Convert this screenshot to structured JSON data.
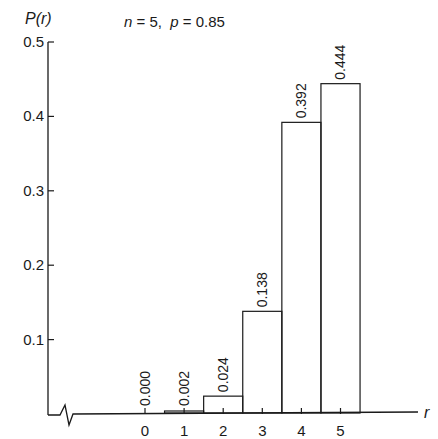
{
  "chart_data": {
    "type": "bar",
    "title": "",
    "subtitle": {
      "n_symbol": "n",
      "n_eq": " = 5,  ",
      "p_symbol": "p",
      "p_eq": " = 0.85"
    },
    "xlabel": "r",
    "ylabel": "P(r)",
    "categories": [
      "0",
      "1",
      "2",
      "3",
      "4",
      "5"
    ],
    "x": [
      0,
      1,
      2,
      3,
      4,
      5
    ],
    "values": [
      0.0,
      0.002,
      0.024,
      0.138,
      0.392,
      0.444
    ],
    "value_labels": [
      "0.000",
      "0.002",
      "0.024",
      "0.138",
      "0.392",
      "0.444"
    ],
    "yticks": [
      0.1,
      0.2,
      0.3,
      0.4,
      0.5
    ],
    "ytick_labels": [
      "0.1",
      "0.2",
      "0.3",
      "0.4",
      "0.5"
    ],
    "ylim": [
      0,
      0.5
    ],
    "x_axis_break": true,
    "grid": false,
    "legend": "none",
    "bar_style": "outlined-histogram"
  }
}
